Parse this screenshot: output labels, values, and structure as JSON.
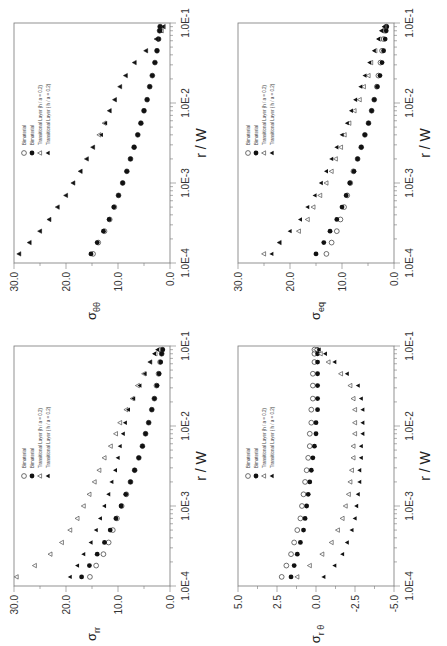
{
  "figure": {
    "x_axis_label": "r / W",
    "x_tick_labels": [
      "1.0E-4",
      "1.0E-3",
      "1.0E-2",
      "1.0E-1"
    ],
    "legend": [
      {
        "marker": "open-circle",
        "label": "Bimaterial"
      },
      {
        "marker": "filled-circle",
        "label": "Bimaterial"
      },
      {
        "marker": "open-triangle",
        "label": "Transitional Layer (h / a = 0.2)"
      },
      {
        "marker": "filled-triangle",
        "label": "Transitional Layer ( h / a = 0.2)"
      }
    ]
  },
  "chart_data": [
    {
      "id": "sigma_thetatheta",
      "type": "scatter",
      "position": "top-left",
      "ylabel": "σθθ",
      "ylabel_main": "σ",
      "ylabel_sub": "θθ",
      "xlabel": "r / W",
      "xscale": "log",
      "xlim": [
        0.0001,
        0.1
      ],
      "ylim": [
        0,
        30
      ],
      "yticks": [
        "0.0",
        "10.0",
        "20.0",
        "30.0"
      ],
      "ytick_values": [
        0,
        10,
        20,
        30
      ],
      "x": [
        0.00013,
        0.00018,
        0.00025,
        0.00035,
        0.0005,
        0.0007,
        0.001,
        0.0014,
        0.002,
        0.0028,
        0.004,
        0.0056,
        0.008,
        0.011,
        0.016,
        0.022,
        0.032,
        0.045,
        0.063,
        0.08,
        0.09
      ],
      "series": [
        {
          "name": "Bimaterial (open)",
          "marker": "open-circle",
          "values": [
            14.8,
            13.8,
            12.6,
            11.6,
            10.7,
            9.9,
            9.1,
            8.3,
            7.6,
            6.9,
            6.2,
            5.6,
            5.0,
            4.4,
            3.9,
            3.4,
            2.9,
            2.5,
            2.2,
            2.0,
            1.9
          ]
        },
        {
          "name": "Bimaterial (filled)",
          "marker": "filled-circle",
          "values": [
            15.2,
            14.0,
            12.8,
            11.7,
            10.8,
            9.9,
            9.1,
            8.3,
            7.6,
            6.9,
            6.2,
            5.6,
            5.0,
            4.4,
            3.9,
            3.4,
            2.9,
            2.5,
            2.2,
            2.0,
            1.9
          ]
        },
        {
          "name": "Transitional Layer open",
          "marker": "open-triangle",
          "values": [
            29.0,
            27.0,
            25.0,
            23.2,
            21.6,
            20.0,
            18.6,
            17.2,
            16.0,
            14.8,
            13.6,
            12.6,
            11.6,
            10.6,
            9.6,
            8.5,
            6.8,
            4.6,
            2.6,
            1.6,
            1.2
          ]
        },
        {
          "name": "Transitional Layer filled",
          "marker": "filled-triangle",
          "values": [
            29.0,
            27.0,
            25.0,
            23.2,
            21.6,
            20.0,
            18.6,
            17.2,
            16.0,
            14.8,
            13.2,
            12.4,
            11.6,
            10.6,
            9.6,
            8.5,
            6.8,
            4.6,
            2.6,
            1.8,
            1.3
          ]
        }
      ]
    },
    {
      "id": "sigma_eq",
      "type": "scatter",
      "position": "top-right",
      "ylabel": "σeq",
      "ylabel_main": "σ",
      "ylabel_sub": "eq",
      "xlabel": "r / W",
      "xscale": "log",
      "xlim": [
        0.0001,
        0.1
      ],
      "ylim": [
        0,
        30
      ],
      "yticks": [
        "0.0",
        "10.0",
        "20.0",
        "30.0"
      ],
      "ytick_values": [
        0,
        10,
        20,
        30
      ],
      "x": [
        0.00013,
        0.00018,
        0.00025,
        0.00035,
        0.0005,
        0.0007,
        0.001,
        0.0014,
        0.002,
        0.0028,
        0.004,
        0.0056,
        0.008,
        0.011,
        0.016,
        0.022,
        0.032,
        0.045,
        0.063,
        0.08,
        0.09
      ],
      "series": [
        {
          "name": "Bimaterial (open)",
          "marker": "open-circle",
          "values": [
            13.0,
            12.0,
            11.0,
            10.3,
            9.6,
            9.0,
            8.4,
            7.8,
            7.0,
            6.3,
            5.6,
            4.9,
            4.3,
            3.8,
            3.3,
            3.0,
            2.6,
            2.3,
            2.0,
            1.7,
            1.5
          ]
        },
        {
          "name": "Bimaterial (filled)",
          "marker": "filled-circle",
          "values": [
            15.0,
            13.5,
            12.3,
            11.0,
            10.0,
            9.2,
            8.5,
            7.7,
            7.0,
            6.3,
            5.6,
            4.9,
            4.3,
            3.8,
            3.2,
            2.7,
            2.3,
            2.0,
            1.7,
            1.5,
            1.4
          ]
        },
        {
          "name": "Transitional Layer open",
          "marker": "open-triangle",
          "values": [
            25.0,
            22.0,
            18.3,
            16.6,
            15.5,
            14.2,
            13.0,
            12.0,
            11.2,
            10.2,
            9.5,
            8.6,
            7.6,
            6.6,
            5.8,
            4.9,
            4.4,
            3.6,
            2.8,
            2.3,
            1.8
          ]
        },
        {
          "name": "Transitional Layer filled",
          "marker": "filled-triangle",
          "values": [
            23.5,
            22.0,
            20.0,
            18.0,
            16.6,
            15.2,
            14.0,
            13.0,
            12.0,
            11.0,
            10.0,
            9.0,
            8.2,
            7.4,
            6.4,
            5.6,
            4.7,
            3.8,
            3.0,
            2.4,
            1.9
          ]
        }
      ]
    },
    {
      "id": "sigma_rr",
      "type": "scatter",
      "position": "bottom-left",
      "ylabel": "σrr",
      "ylabel_main": "σ",
      "ylabel_sub": "rr",
      "xlabel": "r / W",
      "xscale": "log",
      "xlim": [
        0.0001,
        0.1
      ],
      "ylim": [
        0,
        30
      ],
      "yticks": [
        "0.0",
        "10.0",
        "20.0",
        "30.0"
      ],
      "ytick_values": [
        0,
        10,
        20,
        30
      ],
      "x": [
        0.00013,
        0.00018,
        0.00025,
        0.00035,
        0.0005,
        0.0007,
        0.001,
        0.0014,
        0.002,
        0.0028,
        0.004,
        0.0056,
        0.008,
        0.011,
        0.016,
        0.022,
        0.032,
        0.045,
        0.063,
        0.08,
        0.09
      ],
      "series": [
        {
          "name": "Bimaterial (open)",
          "marker": "open-circle",
          "values": [
            15.4,
            14.2,
            12.8,
            11.8,
            11.0,
            10.2,
            9.3,
            8.4,
            7.6,
            6.8,
            6.0,
            5.3,
            4.7,
            4.1,
            3.5,
            3.0,
            2.6,
            2.2,
            1.9,
            1.6,
            1.5
          ]
        },
        {
          "name": "Bimaterial (filled)",
          "marker": "filled-circle",
          "values": [
            17.0,
            15.5,
            14.0,
            12.6,
            11.5,
            10.4,
            9.4,
            8.5,
            7.6,
            6.8,
            6.0,
            5.3,
            4.7,
            4.1,
            3.5,
            3.0,
            2.5,
            2.1,
            1.8,
            1.6,
            1.4
          ]
        },
        {
          "name": "Transitional Layer open",
          "marker": "open-triangle",
          "values": [
            29.5,
            26.0,
            23.0,
            20.8,
            19.2,
            17.8,
            16.6,
            15.5,
            14.5,
            13.6,
            12.6,
            11.4,
            10.4,
            9.6,
            8.4,
            7.2,
            6.2,
            5.0,
            3.8,
            2.8,
            2.2
          ]
        },
        {
          "name": "Transitional Layer filled",
          "marker": "filled-triangle",
          "values": [
            19.2,
            17.8,
            16.6,
            15.2,
            14.2,
            13.4,
            12.6,
            11.8,
            11.2,
            10.5,
            10.0,
            9.6,
            9.0,
            8.6,
            8.0,
            7.0,
            5.8,
            4.8,
            3.8,
            3.0,
            2.4
          ]
        }
      ]
    },
    {
      "id": "sigma_rtheta",
      "type": "scatter",
      "position": "bottom-right",
      "ylabel": "σrθ",
      "ylabel_main": "σ",
      "ylabel_sub": "r θ",
      "xlabel": "r / W",
      "xscale": "log",
      "xlim": [
        0.0001,
        0.1
      ],
      "ylim": [
        -5,
        5
      ],
      "yticks": [
        "-5.0",
        "-2.5",
        "0.0",
        "2.5",
        "5.0"
      ],
      "ytick_values": [
        -5,
        -2.5,
        0,
        2.5,
        5
      ],
      "x": [
        0.00013,
        0.00018,
        0.00025,
        0.00035,
        0.0005,
        0.0007,
        0.001,
        0.0014,
        0.002,
        0.0028,
        0.004,
        0.0056,
        0.008,
        0.011,
        0.016,
        0.022,
        0.032,
        0.045,
        0.063,
        0.08,
        0.09
      ],
      "series": [
        {
          "name": "Bimaterial (open)",
          "marker": "open-circle",
          "values": [
            2.2,
            1.9,
            1.6,
            1.4,
            1.2,
            1.0,
            0.9,
            0.8,
            0.7,
            0.6,
            0.5,
            0.4,
            0.4,
            0.3,
            0.3,
            0.2,
            0.2,
            0.2,
            0.1,
            0.1,
            0.1
          ]
        },
        {
          "name": "Bimaterial (filled)",
          "marker": "filled-circle",
          "values": [
            1.6,
            1.4,
            1.2,
            1.0,
            0.8,
            0.7,
            0.6,
            0.5,
            0.4,
            0.3,
            0.2,
            0.1,
            0.0,
            0.0,
            -0.1,
            -0.1,
            -0.1,
            -0.1,
            -0.1,
            -0.1,
            -0.1
          ]
        },
        {
          "name": "Transitional Layer open",
          "marker": "open-triangle",
          "values": [
            1.2,
            0.4,
            -0.4,
            -1.0,
            -1.4,
            -1.7,
            -1.9,
            -2.1,
            -2.2,
            -2.3,
            -2.4,
            -2.4,
            -2.5,
            -2.5,
            -2.5,
            -2.4,
            -2.2,
            -1.6,
            -0.8,
            -0.3,
            0.0
          ]
        },
        {
          "name": "Transitional Layer filled",
          "marker": "filled-triangle",
          "values": [
            -0.5,
            -1.2,
            -1.7,
            -2.0,
            -2.3,
            -2.5,
            -2.6,
            -2.7,
            -2.8,
            -2.8,
            -2.9,
            -2.9,
            -3.0,
            -3.0,
            -3.0,
            -2.9,
            -2.7,
            -2.0,
            -1.2,
            -0.6,
            -0.2
          ]
        }
      ]
    }
  ]
}
